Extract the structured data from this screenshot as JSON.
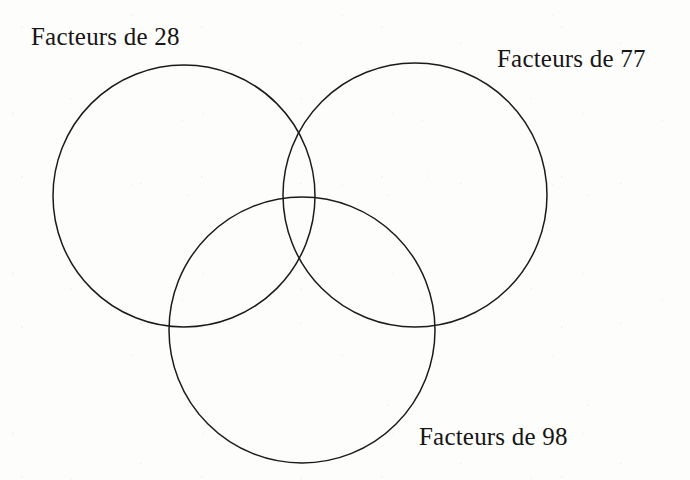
{
  "diagram": {
    "type": "venn-3-circle",
    "title": null,
    "background_color": "#fdfdfb",
    "stroke_color": "#1b1b1b",
    "stroke_width": 1.5,
    "labels": {
      "left": "Facteurs de 28",
      "right": "Facteurs de 77",
      "bottom": "Facteurs de 98"
    },
    "circles": [
      {
        "name": "facteurs-de-28",
        "cx": 184,
        "cy": 196,
        "r": 131
      },
      {
        "name": "facteurs-de-77",
        "cx": 415,
        "cy": 195,
        "r": 132
      },
      {
        "name": "facteurs-de-98",
        "cx": 302,
        "cy": 330,
        "r": 133
      }
    ],
    "region_contents": []
  }
}
